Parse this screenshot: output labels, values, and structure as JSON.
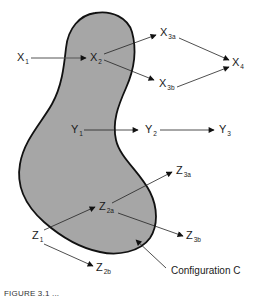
{
  "diagram": {
    "region": {
      "label": "Configuration C",
      "fill_color": "#a6a6a6",
      "stroke_color": "#111111"
    },
    "nodes": {
      "X1": {
        "base": "X",
        "sub": "1"
      },
      "X2": {
        "base": "X",
        "sub": "2"
      },
      "X3a": {
        "base": "X",
        "sub": "3a"
      },
      "X3b": {
        "base": "X",
        "sub": "3b"
      },
      "X4": {
        "base": "X",
        "sub": "4"
      },
      "Y1": {
        "base": "Y",
        "sub": "1"
      },
      "Y2": {
        "base": "Y",
        "sub": "2"
      },
      "Y3": {
        "base": "Y",
        "sub": "3"
      },
      "Z1": {
        "base": "Z",
        "sub": "1"
      },
      "Z2a": {
        "base": "Z",
        "sub": "2a"
      },
      "Z2b": {
        "base": "Z",
        "sub": "2b"
      },
      "Z3a": {
        "base": "Z",
        "sub": "3a"
      },
      "Z3b": {
        "base": "Z",
        "sub": "3b"
      }
    },
    "edges": [
      {
        "from": "X1",
        "to": "X2"
      },
      {
        "from": "X2",
        "to": "X3a"
      },
      {
        "from": "X2",
        "to": "X3b"
      },
      {
        "from": "X3a",
        "to": "X4"
      },
      {
        "from": "X3b",
        "to": "X4"
      },
      {
        "from": "Y1",
        "to": "Y2"
      },
      {
        "from": "Y2",
        "to": "Y3"
      },
      {
        "from": "Z1",
        "to": "Z2a"
      },
      {
        "from": "Z1",
        "to": "Z2b"
      },
      {
        "from": "Z2a",
        "to": "Z3a"
      },
      {
        "from": "Z2a",
        "to": "Z3b"
      }
    ],
    "pointer": {
      "label_ref": "Configuration C",
      "points_to": "region boundary"
    },
    "caption_partial": "FIGURE 3.1  ..."
  }
}
